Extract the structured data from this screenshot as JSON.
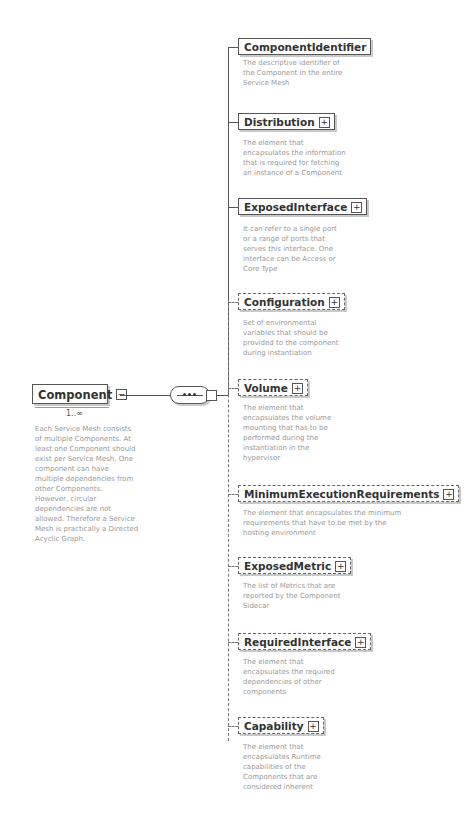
{
  "root": {
    "name": "Component",
    "toggle": "−",
    "cardinality": "1..∞",
    "description": [
      "Each Service Mesh consists",
      "of multiple Components. At",
      "least one Component should",
      "exist per Service Mesh. One",
      "component can have",
      "multiple dependencies from",
      "other Components.",
      "However, circular",
      "dependencies are not",
      "allowed. Therefore a Service",
      "Mesh is practically a Directed",
      "Acyclic Graph."
    ]
  },
  "compositor": {
    "type": "sequence",
    "icon": "sequence-icon"
  },
  "children": [
    {
      "name": "ComponentIdentifier",
      "optional": false,
      "expandable": false,
      "description": [
        "The descriptive identifier of",
        "the Component in the entire",
        "Service Mesh"
      ]
    },
    {
      "name": "Distribution",
      "optional": false,
      "expandable": true,
      "description": [
        "The element that",
        "encapsulates the information",
        "that is required for fetching",
        "an instance of a Component"
      ]
    },
    {
      "name": "ExposedInterface",
      "optional": false,
      "expandable": true,
      "description": [
        "It can refer to a single port",
        "or a range of ports that",
        "serves this interface. One",
        "interface can be Access or",
        "Core Type"
      ]
    },
    {
      "name": "Configuration",
      "optional": true,
      "expandable": true,
      "description": [
        "Set of environmental",
        "variables that should be",
        "provided to the component",
        "during instantiation"
      ]
    },
    {
      "name": "Volume",
      "optional": true,
      "expandable": true,
      "description": [
        "The element that",
        "encapsulates the volume",
        "mounting that has to be",
        "performed during the",
        "instantiation in the",
        "hypervisor"
      ]
    },
    {
      "name": "MinimumExecutionRequirements",
      "optional": true,
      "expandable": true,
      "description": [
        "The element that encapsulates the minimum",
        "requirements that have to be met by the",
        "hosting environment"
      ]
    },
    {
      "name": "ExposedMetric",
      "optional": true,
      "expandable": true,
      "description": [
        "The list of Metrics that are",
        "reported by the Component",
        "Sidecar"
      ]
    },
    {
      "name": "RequiredInterface",
      "optional": true,
      "expandable": true,
      "description": [
        "The element that",
        "encapsulates the required",
        "dependencies of other",
        "components"
      ]
    },
    {
      "name": "Capability",
      "optional": true,
      "expandable": true,
      "description": [
        "The element that",
        "encapsulates Runtime",
        "capabilities of the",
        "Components that are",
        "considered inherent"
      ]
    }
  ],
  "toggle_plus": "+"
}
